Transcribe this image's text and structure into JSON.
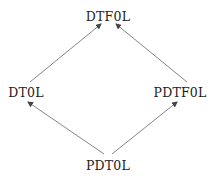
{
  "diagram": {
    "type": "lattice",
    "nodes": [
      {
        "id": "dtf0l",
        "label": "DTF0L",
        "x": 108,
        "y": 16
      },
      {
        "id": "dt0l",
        "label": "DT0L",
        "x": 26,
        "y": 92
      },
      {
        "id": "pdtf0l",
        "label": "PDTF0L",
        "x": 180,
        "y": 92
      },
      {
        "id": "pdt0l",
        "label": "PDT0L",
        "x": 108,
        "y": 165
      }
    ],
    "edges": [
      {
        "from": "pdt0l",
        "to": "dt0l"
      },
      {
        "from": "pdt0l",
        "to": "pdtf0l"
      },
      {
        "from": "dt0l",
        "to": "dtf0l"
      },
      {
        "from": "pdtf0l",
        "to": "dtf0l"
      }
    ],
    "colors": {
      "line": "#555555",
      "text": "#222222"
    }
  }
}
